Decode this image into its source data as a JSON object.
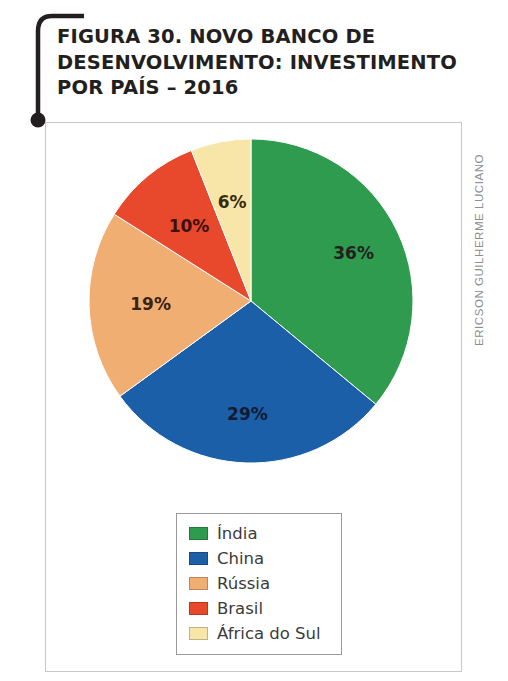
{
  "figure": {
    "title": "FIGURA 30. NOVO BANCO DE\nDESENVOLVIMENTO: INVESTIMENTO\nPOR PAÍS – 2016",
    "credit": "ERICSON GUILHERME LUCIANO"
  },
  "chart_data": {
    "type": "pie",
    "title": "FIGURA 30. NOVO BANCO DE DESENVOLVIMENTO: INVESTIMENTO POR PAÍS – 2016",
    "xlabel": "",
    "ylabel": "",
    "unit": "%",
    "legend_position": "bottom-center",
    "grid": false,
    "start_angle_deg": 0,
    "direction": "clockwise",
    "categories": [
      "Índia",
      "China",
      "Rússia",
      "Brasil",
      "África do Sul"
    ],
    "values": [
      36,
      29,
      19,
      10,
      6
    ],
    "labels": [
      "36%",
      "29%",
      "19%",
      "10%",
      "6%"
    ],
    "colors": [
      "#2E9B4E",
      "#1B5FA8",
      "#F0AE73",
      "#E8492C",
      "#F7E6A8"
    ],
    "label_colors": [
      "#231f20",
      "#101b33",
      "#3a2410",
      "#3a1008",
      "#3a2a10"
    ],
    "slices": [
      {
        "name": "Índia",
        "value": 36,
        "label": "36%",
        "color": "#2E9B4E",
        "label_color": "#231f20"
      },
      {
        "name": "China",
        "value": 29,
        "label": "29%",
        "color": "#1B5FA8",
        "label_color": "#101b33"
      },
      {
        "name": "Rússia",
        "value": 19,
        "label": "19%",
        "color": "#F0AE73",
        "label_color": "#3a2410"
      },
      {
        "name": "Brasil",
        "value": 10,
        "label": "10%",
        "color": "#E8492C",
        "label_color": "#3a1008"
      },
      {
        "name": "África do Sul",
        "value": 6,
        "label": "6%",
        "color": "#F7E6A8",
        "label_color": "#3a2a10"
      }
    ]
  },
  "legend": {
    "items": [
      {
        "label": "Índia",
        "color": "#2E9B4E"
      },
      {
        "label": "China",
        "color": "#1B5FA8"
      },
      {
        "label": "Rússia",
        "color": "#F0AE73"
      },
      {
        "label": "Brasil",
        "color": "#E8492C"
      },
      {
        "label": "África do Sul",
        "color": "#F7E6A8"
      }
    ]
  },
  "colors": {
    "title_text": "#231f20",
    "frame_border": "#c8c8c8",
    "legend_border": "#9a9a9a",
    "credit_text": "#8d8d8d",
    "bracket": "#231f20"
  }
}
